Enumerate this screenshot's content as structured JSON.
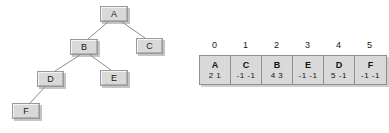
{
  "diagram": {
    "tree": {
      "nodes": [
        {
          "id": "A",
          "label": "A",
          "x": 100,
          "y": 6,
          "w": 28,
          "h": 16
        },
        {
          "id": "B",
          "label": "B",
          "x": 70,
          "y": 39,
          "w": 28,
          "h": 16
        },
        {
          "id": "C",
          "label": "C",
          "x": 136,
          "y": 38,
          "w": 27,
          "h": 16
        },
        {
          "id": "D",
          "label": "D",
          "x": 37,
          "y": 71,
          "w": 27,
          "h": 16
        },
        {
          "id": "E",
          "label": "E",
          "x": 100,
          "y": 70,
          "w": 28,
          "h": 16
        },
        {
          "id": "F",
          "label": "F",
          "x": 12,
          "y": 103,
          "w": 28,
          "h": 16
        }
      ],
      "edges": [
        {
          "from": "A",
          "to": "B",
          "x1": 108,
          "y1": 22,
          "x2": 88,
          "y2": 39
        },
        {
          "from": "A",
          "to": "C",
          "x1": 122,
          "y1": 22,
          "x2": 145,
          "y2": 38
        },
        {
          "from": "B",
          "to": "D",
          "x1": 80,
          "y1": 55,
          "x2": 55,
          "y2": 71
        },
        {
          "from": "B",
          "to": "E",
          "x1": 90,
          "y1": 55,
          "x2": 111,
          "y2": 70
        },
        {
          "from": "D",
          "to": "F",
          "x1": 45,
          "y1": 87,
          "x2": 30,
          "y2": 103
        }
      ],
      "line_color": "#8c8c8c",
      "node_fill": "#d9d9d9",
      "node_border": "#9a9a9a"
    },
    "array": {
      "indices": [
        "0",
        "1",
        "2",
        "3",
        "4",
        "5"
      ],
      "cells": [
        {
          "key": "A",
          "left": "2",
          "right": "1"
        },
        {
          "key": "C",
          "left": "-1",
          "right": "-1"
        },
        {
          "key": "B",
          "left": "4",
          "right": "3"
        },
        {
          "key": "E",
          "left": "-1",
          "right": "-1"
        },
        {
          "key": "D",
          "left": "5",
          "right": "-1"
        },
        {
          "key": "F",
          "left": "-1",
          "right": "-1"
        }
      ]
    }
  }
}
